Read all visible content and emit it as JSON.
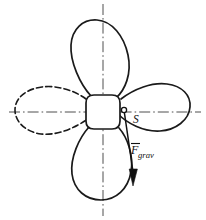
{
  "figure": {
    "background_color": "#ffffff",
    "line_color": "#1a1a1a",
    "centerline_color": "#3a3a3a",
    "width": 206,
    "height": 220
  },
  "labels": {
    "center_of_mass": "S",
    "force_symbol": "F",
    "force_subscript": "grav",
    "force_full": "Fgrav"
  },
  "hub": {
    "name": "propeller-hub",
    "center_x": 103,
    "center_y": 112,
    "radius": 17
  },
  "blades": [
    {
      "name": "blade-top",
      "position": "top",
      "style": "solid",
      "visible": true,
      "tip_x": 98,
      "tip_y": 20
    },
    {
      "name": "blade-right",
      "position": "right",
      "style": "solid",
      "visible": true,
      "tip_x": 190,
      "tip_y": 106
    },
    {
      "name": "blade-bottom",
      "position": "bottom",
      "style": "solid",
      "visible": true,
      "tip_x": 108,
      "tip_y": 200
    },
    {
      "name": "blade-left",
      "position": "left",
      "style": "dashed",
      "visible": false,
      "tip_x": 16,
      "tip_y": 112
    }
  ],
  "axes": [
    {
      "name": "vertical-centerline",
      "orientation": "vertical",
      "x1": 103,
      "y1": 4,
      "x2": 103,
      "y2": 216,
      "style": "dash-dot"
    },
    {
      "name": "horizontal-centerline",
      "orientation": "horizontal",
      "x1": 9,
      "y1": 112,
      "x2": 201,
      "y2": 112,
      "style": "dash-dot"
    }
  ],
  "force_vector": {
    "name": "gravity-force-vector",
    "origin_x": 124,
    "origin_y": 110,
    "tip_x": 134,
    "tip_y": 186,
    "direction": "downward",
    "label": "Fgrav"
  },
  "marker": {
    "name": "center-of-mass-marker",
    "x": 124,
    "y": 110,
    "radius": 2.6
  }
}
